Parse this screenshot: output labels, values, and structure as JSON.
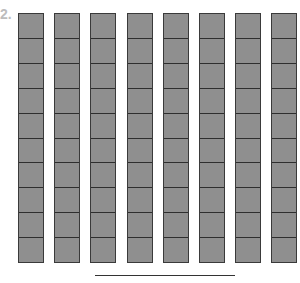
{
  "question": {
    "number_label": "2.",
    "model": "base-ten rods",
    "rod_count": 8,
    "cells_per_rod": 10,
    "rod_fill_color": "#8f8f8f",
    "rod_border_color": "#3a3a3a",
    "answer_value": ""
  }
}
